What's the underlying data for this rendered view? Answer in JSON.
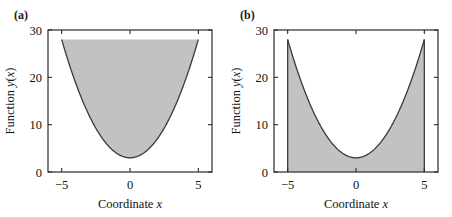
{
  "figure": {
    "background": "#ffffff",
    "curve_color": "#3a3a3a",
    "fill_color": "#c2c2c2",
    "axis_color": "#2b2b2b"
  },
  "panels": [
    {
      "label": "(a)",
      "shading": "above-curve",
      "xlabel_prefix": "Coordinate ",
      "xlabel_var": "x",
      "ylabel_prefix": "Function ",
      "ylabel_var": "y",
      "ylabel_arg_open": "(",
      "ylabel_arg_var": "x",
      "ylabel_arg_close": ")",
      "xticks": [
        "−5",
        "0",
        "5"
      ],
      "yticks": [
        "0",
        "10",
        "20",
        "30"
      ]
    },
    {
      "label": "(b)",
      "shading": "below-curve",
      "xlabel_prefix": "Coordinate ",
      "xlabel_var": "x",
      "ylabel_prefix": "Function ",
      "ylabel_var": "y",
      "ylabel_arg_open": "(",
      "ylabel_arg_var": "x",
      "ylabel_arg_close": ")",
      "xticks": [
        "−5",
        "0",
        "5"
      ],
      "yticks": [
        "0",
        "10",
        "20",
        "30"
      ]
    }
  ],
  "chart_data": [
    {
      "type": "area",
      "title": "(a)",
      "xlabel": "Coordinate x",
      "ylabel": "Function y(x)",
      "xlim": [
        -6,
        6
      ],
      "ylim": [
        0,
        30
      ],
      "xticks": [
        -5,
        0,
        5
      ],
      "yticks": [
        0,
        10,
        20,
        30
      ],
      "grid": false,
      "legend": "none",
      "function": "y = x^2 + 3",
      "x_domain": [
        -5,
        5
      ],
      "fill_description": "region between the curve y=x^2+3 and the horizontal line y=28, over -5 <= x <= 5",
      "fill_baseline": 28,
      "fill_direction": "above-curve",
      "x": [
        -5,
        -4.5,
        -4,
        -3.5,
        -3,
        -2.5,
        -2,
        -1.5,
        -1,
        -0.5,
        0,
        0.5,
        1,
        1.5,
        2,
        2.5,
        3,
        3.5,
        4,
        4.5,
        5
      ],
      "y": [
        28,
        23.25,
        19,
        15.25,
        12,
        9.25,
        7,
        5.25,
        4,
        3.25,
        3,
        3.25,
        4,
        5.25,
        7,
        9.25,
        12,
        15.25,
        19,
        23.25,
        28
      ]
    },
    {
      "type": "area",
      "title": "(b)",
      "xlabel": "Coordinate x",
      "ylabel": "Function y(x)",
      "xlim": [
        -6,
        6
      ],
      "ylim": [
        0,
        30
      ],
      "xticks": [
        -5,
        0,
        5
      ],
      "yticks": [
        0,
        10,
        20,
        30
      ],
      "grid": false,
      "legend": "none",
      "function": "y = x^2 + 3",
      "x_domain": [
        -5,
        5
      ],
      "fill_description": "region between the curve y=x^2+3 and the axis y=0, over -5 <= x <= 5",
      "fill_baseline": 0,
      "fill_direction": "below-curve",
      "x": [
        -5,
        -4.5,
        -4,
        -3.5,
        -3,
        -2.5,
        -2,
        -1.5,
        -1,
        -0.5,
        0,
        0.5,
        1,
        1.5,
        2,
        2.5,
        3,
        3.5,
        4,
        4.5,
        5
      ],
      "y": [
        28,
        23.25,
        19,
        15.25,
        12,
        9.25,
        7,
        5.25,
        4,
        3.25,
        3,
        3.25,
        4,
        5.25,
        7,
        9.25,
        12,
        15.25,
        19,
        23.25,
        28
      ]
    }
  ]
}
